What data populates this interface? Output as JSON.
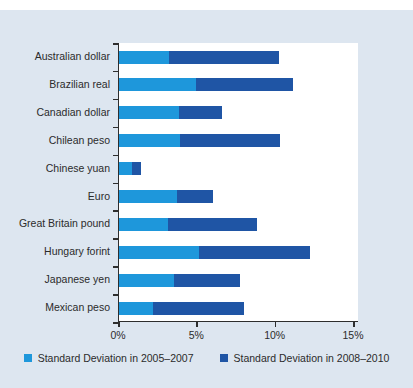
{
  "page": {
    "background": "#ffffff",
    "card_background": "#dde6f0",
    "axis_color": "#2e2e2e",
    "text_color": "#2b2b2b"
  },
  "chart_data": {
    "type": "bar",
    "orientation": "horizontal",
    "stacked": true,
    "grid": false,
    "legend_position": "bottom",
    "categories": [
      "Australian dollar",
      "Brazilian real",
      "Canadian dollar",
      "Chilean peso",
      "Chinese yuan",
      "Euro",
      "Great Britain pound",
      "Hungary forint",
      "Japanese yen",
      "Mexican peso"
    ],
    "series": [
      {
        "name": "Standard Deviation in 2005–2007",
        "color": "#1e97db",
        "values": [
          3.2,
          4.9,
          3.8,
          3.9,
          0.8,
          3.7,
          3.1,
          5.1,
          3.5,
          2.2
        ]
      },
      {
        "name": "Standard Deviation in 2008–2010",
        "color": "#1f55a5",
        "values": [
          7.0,
          6.2,
          2.8,
          6.4,
          0.6,
          2.3,
          5.7,
          7.1,
          4.2,
          5.8
        ]
      }
    ],
    "stacked_totals": [
      10.2,
      11.1,
      6.6,
      10.3,
      1.4,
      6.0,
      8.8,
      12.2,
      7.7,
      8.0
    ],
    "x_axis": {
      "tick_labels": [
        "0%",
        "5%",
        "10%",
        "15%"
      ],
      "tick_values": [
        0,
        5,
        10,
        15
      ],
      "min": 0,
      "max": 15
    }
  }
}
